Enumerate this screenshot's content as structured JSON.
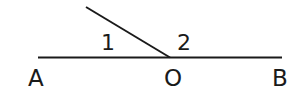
{
  "diagram": {
    "type": "geometry-angles",
    "line_color": "#1a1a1a",
    "background": "#ffffff",
    "points": {
      "A": {
        "label": "A"
      },
      "O": {
        "label": "O"
      },
      "B": {
        "label": "B"
      }
    },
    "angles": [
      {
        "label": "1"
      },
      {
        "label": "2"
      }
    ]
  }
}
